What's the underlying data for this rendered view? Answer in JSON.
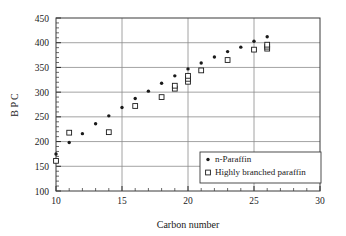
{
  "chart_data": {
    "type": "scatter",
    "title": "",
    "xlabel": "Carbon number",
    "ylabel": "B P C",
    "xlim": [
      10,
      30
    ],
    "ylim": [
      100,
      450
    ],
    "xticks": [
      10,
      15,
      20,
      25,
      30
    ],
    "yticks": [
      100,
      150,
      200,
      250,
      300,
      350,
      400,
      450
    ],
    "xtick_labels": [
      "10",
      "15",
      "20",
      "25",
      "30"
    ],
    "ytick_labels": [
      "100",
      "150",
      "200",
      "250",
      "300",
      "350",
      "400",
      "450"
    ],
    "x_minor_tick_step": 1,
    "y_minor_tick_step": 10,
    "grid": "horizontal-and-vertical-major",
    "legend_position": "lower-right-inside",
    "series": [
      {
        "name": "n-Paraffin",
        "marker": "filled-circle",
        "color": "#1a1a1a",
        "points": [
          {
            "x": 10,
            "y": 175
          },
          {
            "x": 11,
            "y": 198
          },
          {
            "x": 12,
            "y": 216
          },
          {
            "x": 13,
            "y": 236
          },
          {
            "x": 14,
            "y": 252
          },
          {
            "x": 15,
            "y": 269
          },
          {
            "x": 16,
            "y": 287
          },
          {
            "x": 17,
            "y": 302
          },
          {
            "x": 18,
            "y": 318
          },
          {
            "x": 19,
            "y": 333
          },
          {
            "x": 20,
            "y": 347
          },
          {
            "x": 21,
            "y": 359
          },
          {
            "x": 22,
            "y": 371
          },
          {
            "x": 23,
            "y": 382
          },
          {
            "x": 24,
            "y": 391
          },
          {
            "x": 25,
            "y": 403
          },
          {
            "x": 26,
            "y": 412
          }
        ]
      },
      {
        "name": "Highly branched paraffin",
        "marker": "open-square",
        "color": "#1a1a1a",
        "points": [
          {
            "x": 10,
            "y": 161
          },
          {
            "x": 11,
            "y": 218
          },
          {
            "x": 14,
            "y": 219
          },
          {
            "x": 16,
            "y": 272
          },
          {
            "x": 18,
            "y": 290
          },
          {
            "x": 19,
            "y": 307
          },
          {
            "x": 19,
            "y": 313
          },
          {
            "x": 20,
            "y": 321
          },
          {
            "x": 20,
            "y": 327
          },
          {
            "x": 20,
            "y": 333
          },
          {
            "x": 21,
            "y": 344
          },
          {
            "x": 23,
            "y": 365
          },
          {
            "x": 25,
            "y": 386
          },
          {
            "x": 26,
            "y": 388
          },
          {
            "x": 26,
            "y": 392
          },
          {
            "x": 26,
            "y": 396
          }
        ]
      }
    ]
  },
  "legend": {
    "entries": [
      {
        "label": "n-Paraffin",
        "marker": "filled-circle"
      },
      {
        "label": "Highly branched paraffin",
        "marker": "open-square"
      }
    ]
  }
}
